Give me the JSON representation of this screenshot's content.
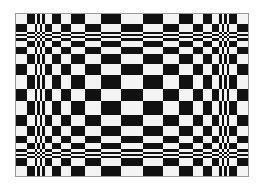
{
  "figure": {
    "name": "bulging checkerboard optical illusion",
    "colors": {
      "dark": "#111111",
      "light": "#f4f4f4",
      "border": "#9a9a9a",
      "background": "#ffffff"
    },
    "first_cell_color": "light",
    "column_widths": [
      11,
      8,
      2,
      3,
      2,
      3,
      7,
      9,
      10,
      14,
      16,
      20,
      22,
      20,
      16,
      14,
      10,
      9,
      7,
      3,
      2,
      3,
      2,
      8,
      11
    ],
    "row_heights": [
      10,
      8,
      2,
      2,
      2,
      3,
      6,
      7,
      10,
      11,
      14,
      12,
      14,
      11,
      10,
      7,
      6,
      3,
      2,
      2,
      2,
      8,
      10
    ]
  }
}
